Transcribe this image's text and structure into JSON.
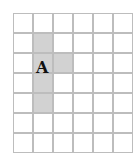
{
  "figure": {
    "cols": 6,
    "rows": 7,
    "cell_size": 20,
    "shaded_cells": [
      [
        1,
        1
      ],
      [
        1,
        2
      ],
      [
        2,
        2
      ],
      [
        1,
        3
      ],
      [
        1,
        4
      ]
    ],
    "shape_label": "A",
    "shade_color": "#d2d2d2",
    "grid_color": "#bdbdbd"
  }
}
